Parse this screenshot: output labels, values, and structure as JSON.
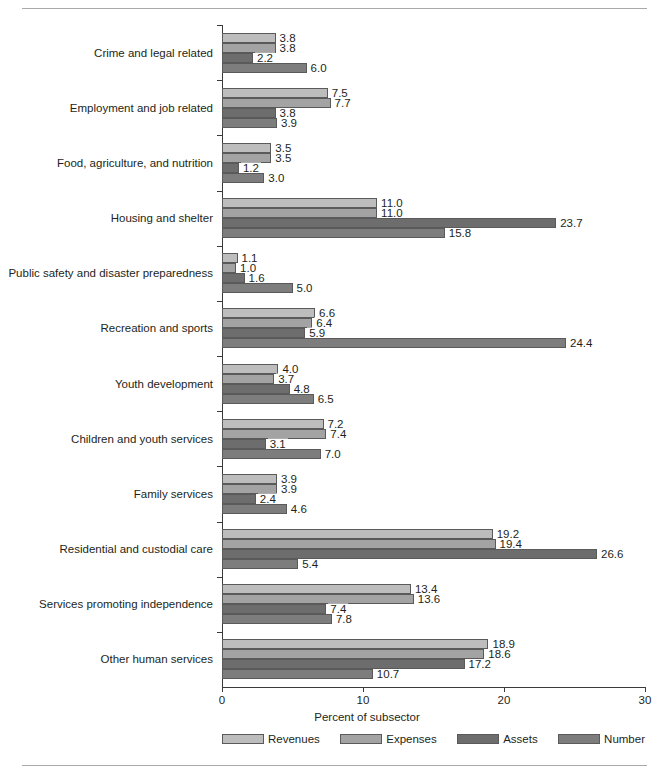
{
  "chart_data": {
    "type": "bar",
    "orientation": "horizontal",
    "title": "",
    "xlabel": "Percent of subsector",
    "ylabel": "",
    "xlim": [
      0,
      30
    ],
    "xticks": [
      0,
      10,
      20,
      30
    ],
    "xtick_labels": [
      "0",
      "10",
      "20",
      "30"
    ],
    "grid": false,
    "legend_position": "bottom",
    "categories": [
      "Crime and legal related",
      "Employment and job related",
      "Food, agriculture, and nutrition",
      "Housing and shelter",
      "Public safety and disaster preparedness",
      "Recreation and sports",
      "Youth development",
      "Children and youth services",
      "Family services",
      "Residential and custodial care",
      "Services promoting independence",
      "Other human services"
    ],
    "series": [
      {
        "name": "Revenues",
        "color": "#bdbdbd",
        "values": [
          3.8,
          7.5,
          3.5,
          11.0,
          1.1,
          6.6,
          4.0,
          7.2,
          3.9,
          19.2,
          13.4,
          18.9
        ],
        "labels": [
          "3.8",
          "7.5",
          "3.5",
          "11.0",
          "1.1",
          "6.6",
          "4.0",
          "7.2",
          "3.9",
          "19.2",
          "13.4",
          "18.9"
        ]
      },
      {
        "name": "Expenses",
        "color": "#a3a3a3",
        "values": [
          3.8,
          7.7,
          3.5,
          11.0,
          1.0,
          6.4,
          3.7,
          7.4,
          3.9,
          19.4,
          13.6,
          18.6
        ],
        "labels": [
          "3.8",
          "7.7",
          "3.5",
          "11.0",
          "1.0",
          "6.4",
          "3.7",
          "7.4",
          "3.9",
          "19.4",
          "13.6",
          "18.6"
        ]
      },
      {
        "name": "Assets",
        "color": "#6d6d6d",
        "values": [
          2.2,
          3.8,
          1.2,
          23.7,
          1.6,
          5.9,
          4.8,
          3.1,
          2.4,
          26.6,
          7.4,
          17.2
        ],
        "labels": [
          "2.2",
          "3.8",
          "1.2",
          "23.7",
          "1.6",
          "5.9",
          "4.8",
          "3.1",
          "2.4",
          "26.6",
          "7.4",
          "17.2"
        ]
      },
      {
        "name": "Number",
        "color": "#7d7d7d",
        "values": [
          6.0,
          3.9,
          3.0,
          15.8,
          5.0,
          24.4,
          6.5,
          7.0,
          4.6,
          5.4,
          7.8,
          10.7
        ],
        "labels": [
          "6.0",
          "3.9",
          "3.0",
          "15.8",
          "5.0",
          "24.4",
          "6.5",
          "7.0",
          "4.6",
          "5.4",
          "7.8",
          "10.7"
        ]
      }
    ]
  }
}
